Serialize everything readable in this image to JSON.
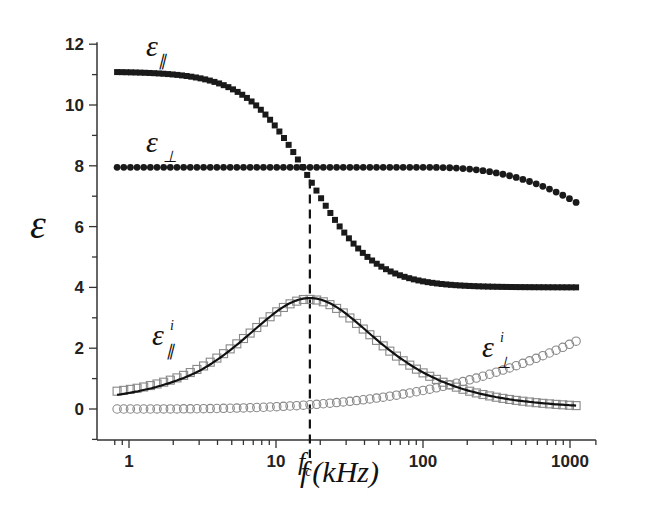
{
  "chart_data": {
    "type": "scatter",
    "title": "",
    "xlabel": "f (kHz)",
    "ylabel": "ε",
    "xscale": "log",
    "xlim": [
      0.7,
      1500
    ],
    "ylim": [
      -1,
      12
    ],
    "xticks": [
      1,
      10,
      100,
      1000
    ],
    "xtick_labels": [
      "1",
      "10",
      "100",
      "1000"
    ],
    "yticks": [
      0,
      2,
      4,
      6,
      8,
      10,
      12
    ],
    "ytick_labels": [
      "0",
      "2",
      "4",
      "6",
      "8",
      "10",
      "12"
    ],
    "grid": false,
    "legend": "inline labels",
    "annotations": [
      {
        "text": "fc",
        "x": 17,
        "note": "critical frequency, dashed vertical line"
      }
    ],
    "fc_kHz": 17,
    "series": [
      {
        "name": "ε∥",
        "marker": "filled square",
        "model": "debye",
        "eps_low": 11.1,
        "eps_high": 4.0,
        "fc": 17,
        "x_range": [
          0.83,
          1100
        ]
      },
      {
        "name": "ε⊥",
        "marker": "filled circle",
        "start": 7.95,
        "end": 6.8,
        "x_range": [
          0.83,
          1100
        ]
      },
      {
        "name": "ε∥ⁱ",
        "marker": "open square",
        "peak": 3.6,
        "peak_x": 17,
        "start": 0.65,
        "end": 0.05,
        "x_range": [
          0.83,
          1100
        ]
      },
      {
        "name": "ε∥ⁱ fit",
        "marker": "solid line",
        "peak": 3.65,
        "peak_x": 17,
        "start": 0.4,
        "end": 0.05
      },
      {
        "name": "ε⊥ⁱ",
        "marker": "open circle",
        "start": 0.0,
        "end": 2.23,
        "x_range": [
          0.83,
          1100
        ]
      }
    ]
  },
  "labels": {
    "y_axis": "ε",
    "x_axis_f": "f",
    "x_axis_unit": "(kHz)",
    "fc_main": "f",
    "fc_sub": "c",
    "eps": "ε",
    "par": "∥",
    "perp": "⊥",
    "imag": "i"
  }
}
